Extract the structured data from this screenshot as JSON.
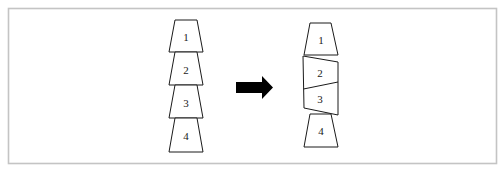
{
  "diagram": {
    "colors": {
      "stroke": "#1a1a1a",
      "fill": "#ffffff",
      "frame": "#c4c4c4",
      "arrow": "#000000"
    },
    "left_stack": {
      "blocks": [
        {
          "label": "1"
        },
        {
          "label": "2"
        },
        {
          "label": "3"
        },
        {
          "label": "4"
        }
      ]
    },
    "arrow": {
      "direction": "right",
      "icon": "arrow-right-icon"
    },
    "right_stack": {
      "blocks": [
        {
          "label": "1"
        },
        {
          "label": "2"
        },
        {
          "label": "3"
        },
        {
          "label": "4"
        }
      ]
    }
  }
}
